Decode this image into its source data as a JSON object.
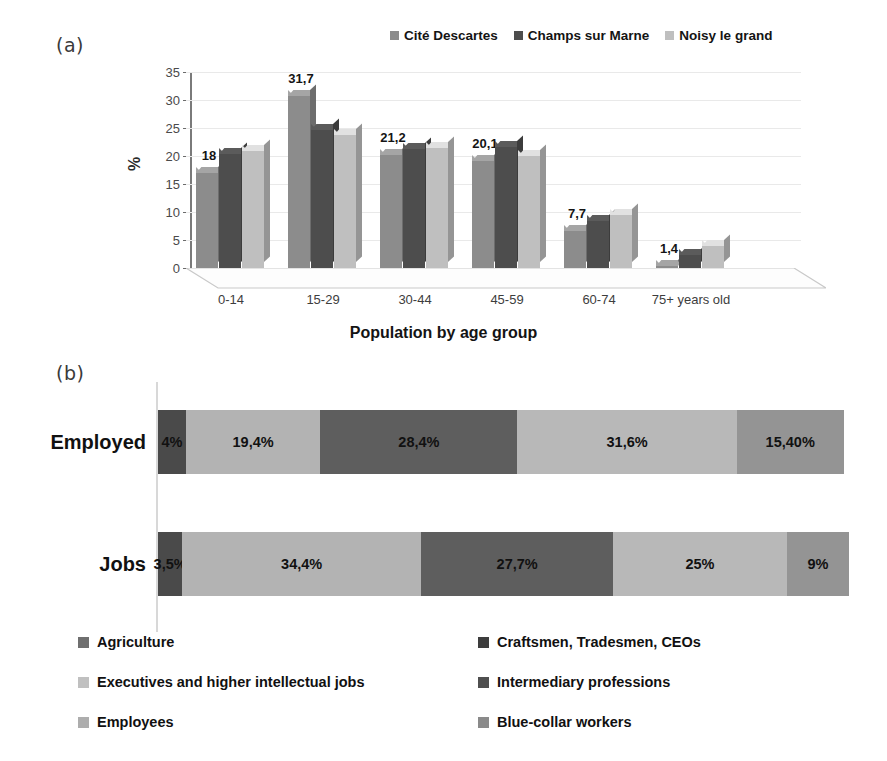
{
  "panels": {
    "a_label": "(a)",
    "b_label": "(b)"
  },
  "chart_data": [
    {
      "type": "bar",
      "panel": "(a)",
      "title": "",
      "xlabel": "Population by age group",
      "ylabel": "%",
      "ylim": [
        0,
        35
      ],
      "yticks": [
        0,
        5,
        10,
        15,
        20,
        25,
        30,
        35
      ],
      "grid": true,
      "legend_position": "top-right",
      "categories": [
        "0-14",
        "15-29",
        "30-44",
        "45-59",
        "60-74",
        "75+ years old"
      ],
      "series": [
        {
          "name": "Cité Descartes",
          "color": "#8c8c8c",
          "values": [
            18,
            31.7,
            21.2,
            20.1,
            7.7,
            1.4
          ],
          "labels": [
            "18",
            "31,7",
            "21,2",
            "20,1",
            "7,7",
            "1,4"
          ]
        },
        {
          "name": "Champs sur Marne",
          "color": "#4d4d4d",
          "values": [
            21.5,
            25.8,
            22.3,
            22.6,
            9.5,
            3.4
          ],
          "labels": [
            "",
            "",
            "",
            "",
            "",
            ""
          ]
        },
        {
          "name": "Noisy le grand",
          "color": "#bfbfbf",
          "values": [
            21.9,
            24.9,
            22.5,
            21.1,
            10.6,
            5.0
          ],
          "labels": [
            "",
            "",
            "",
            "",
            "",
            ""
          ]
        }
      ]
    },
    {
      "type": "bar",
      "panel": "(b)",
      "subtype": "stacked-horizontal-100",
      "title": "",
      "xlabel": "",
      "ylabel": "",
      "categories": [
        "Employed",
        "Jobs"
      ],
      "legend_position": "bottom",
      "series": [
        {
          "name": "Agriculture",
          "color": "#4a4a4a",
          "values": [
            4,
            3.5
          ],
          "labels": [
            "4%",
            "3,5%"
          ]
        },
        {
          "name": "Craftsmen, Tradesmen, CEOs",
          "color": "#b3b3b3",
          "values": [
            19.4,
            34.4
          ],
          "labels": [
            "19,4%",
            "34,4%"
          ]
        },
        {
          "name": "Executives and higher intellectual jobs",
          "color": "#5e5e5e",
          "values": [
            28.4,
            27.7
          ],
          "labels": [
            "28,4%",
            "27,7%"
          ]
        },
        {
          "name": "Intermediary professions",
          "color": "#b8b8b8",
          "values": [
            31.6,
            25
          ],
          "labels": [
            "31,6%",
            "25%"
          ]
        },
        {
          "name": "Employees",
          "color": "#949494",
          "values": [
            15.4,
            9
          ],
          "labels": [
            "15,40%",
            "9%"
          ]
        }
      ],
      "legend_entries": [
        {
          "label": "Agriculture",
          "color": "#6f6f6f"
        },
        {
          "label": "Craftsmen, Tradesmen, CEOs",
          "color": "#3d3d3d"
        },
        {
          "label": "Executives and higher intellectual jobs",
          "color": "#c0c0c0"
        },
        {
          "label": "Intermediary professions",
          "color": "#4f4f4f"
        },
        {
          "label": "Employees",
          "color": "#adadad"
        },
        {
          "label": "Blue-collar workers",
          "color": "#8a8a8a"
        }
      ]
    }
  ]
}
